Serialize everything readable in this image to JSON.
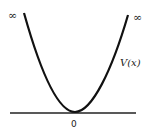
{
  "diagram": {
    "curve_label": "V(x)",
    "left_limit_label": "∞",
    "right_limit_label": "∞",
    "origin_label": "0",
    "colors": {
      "curve": "#111111",
      "axis": "#222222",
      "background": "#ffffff"
    }
  }
}
